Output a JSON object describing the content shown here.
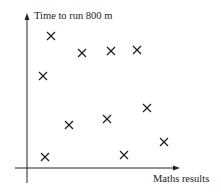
{
  "chart_data": {
    "type": "scatter",
    "title": "",
    "xlabel": "Maths results",
    "ylabel": "Time to run 800 m",
    "grid": false,
    "legend": null,
    "marker": "x",
    "axis_ticks": "none",
    "points_px": [
      {
        "x": 51,
        "y": 36
      },
      {
        "x": 82,
        "y": 53
      },
      {
        "x": 111,
        "y": 51
      },
      {
        "x": 137,
        "y": 50
      },
      {
        "x": 43,
        "y": 76
      },
      {
        "x": 147,
        "y": 108
      },
      {
        "x": 107,
        "y": 119
      },
      {
        "x": 69,
        "y": 125
      },
      {
        "x": 164,
        "y": 142
      },
      {
        "x": 45,
        "y": 157
      },
      {
        "x": 124,
        "y": 155
      }
    ],
    "points_relative": [
      {
        "x": 0.16,
        "y": 0.87
      },
      {
        "x": 0.36,
        "y": 0.75
      },
      {
        "x": 0.55,
        "y": 0.77
      },
      {
        "x": 0.72,
        "y": 0.78
      },
      {
        "x": 0.11,
        "y": 0.6
      },
      {
        "x": 0.78,
        "y": 0.4
      },
      {
        "x": 0.52,
        "y": 0.32
      },
      {
        "x": 0.28,
        "y": 0.28
      },
      {
        "x": 0.9,
        "y": 0.17
      },
      {
        "x": 0.12,
        "y": 0.07
      },
      {
        "x": 0.64,
        "y": 0.09
      }
    ]
  },
  "labels": {
    "y_axis": "Time to run 800 m",
    "x_axis": "Maths results"
  }
}
